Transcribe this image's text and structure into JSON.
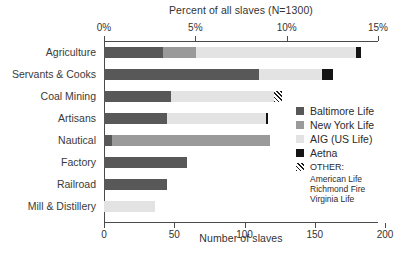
{
  "chart_data": {
    "type": "bar",
    "orientation": "horizontal",
    "stacked": true,
    "title": "Percent of all slaves (N=1300)",
    "xlabel_top": "Percent of all slaves (N=1300)",
    "xlabel_bottom": "Number of slaves",
    "ylabel": "",
    "categories": [
      "Agriculture",
      "Servants & Cooks",
      "Coal Mining",
      "Artisans",
      "Nautical",
      "Factory",
      "Railroad",
      "Mill & Distillery"
    ],
    "series": [
      {
        "name": "Baltimore Life",
        "color": "#585858",
        "values": [
          48,
          112,
          49,
          46,
          6,
          61,
          46,
          0
        ]
      },
      {
        "name": "New York Life",
        "color": "#9a9a9a",
        "values": [
          24,
          0,
          0,
          0,
          115,
          0,
          0,
          0
        ]
      },
      {
        "name": "AIG (US Life)",
        "color": "#e3e3e3",
        "values": [
          116,
          47,
          74,
          74,
          0,
          0,
          0,
          37
        ]
      },
      {
        "name": "Aetna",
        "color": "#141414",
        "values": [
          4,
          8,
          0,
          2,
          0,
          0,
          0,
          0
        ]
      },
      {
        "name": "OTHER",
        "color": "hatched",
        "values": [
          0,
          0,
          5,
          0,
          0,
          0,
          0,
          0
        ]
      }
    ],
    "totals": [
      192,
      167,
      128,
      122,
      121,
      61,
      46,
      37
    ],
    "x_top_ticks": [
      "0%",
      "5%",
      "10%",
      "15%"
    ],
    "x_top_values": [
      0,
      5,
      10,
      15
    ],
    "x_bottom_ticks": [
      "0",
      "50",
      "100",
      "150",
      "200"
    ],
    "x_bottom_values": [
      0,
      50,
      100,
      150,
      200
    ],
    "xlim_top": [
      0,
      15
    ],
    "xlim_bottom": [
      0,
      200
    ],
    "grid": false,
    "legend_position": "right"
  },
  "axis": {
    "top_title": "Percent of all slaves (N=1300)",
    "bottom_title": "Number of slaves",
    "top_ticks": [
      {
        "label": "0%",
        "pct": 0
      },
      {
        "label": "5%",
        "pct": 5
      },
      {
        "label": "10%",
        "pct": 10
      },
      {
        "label": "15%",
        "pct": 15
      }
    ],
    "bottom_ticks": [
      {
        "label": "0",
        "pct": 0
      },
      {
        "label": "50",
        "pct": 3.846
      },
      {
        "label": "100",
        "pct": 7.692
      },
      {
        "label": "150",
        "pct": 11.538
      },
      {
        "label": "200",
        "pct": 15.385
      }
    ]
  },
  "bars": [
    {
      "label": "Agriculture",
      "segments": [
        {
          "series": "Baltimore Life",
          "class": "baltimore",
          "start": 0.0,
          "len": 3.23
        },
        {
          "series": "New York Life",
          "class": "newyork",
          "start": 3.23,
          "len": 1.8
        },
        {
          "series": "AIG (US Life)",
          "class": "aig",
          "start": 5.03,
          "len": 8.74
        },
        {
          "series": "Aetna",
          "class": "aetna",
          "start": 13.77,
          "len": 0.3
        }
      ]
    },
    {
      "label": "Servants & Cooks",
      "segments": [
        {
          "series": "Baltimore Life",
          "class": "baltimore",
          "start": 0.0,
          "len": 8.48
        },
        {
          "series": "AIG (US Life)",
          "class": "aig",
          "start": 8.48,
          "len": 3.45
        },
        {
          "series": "Aetna",
          "class": "aetna",
          "start": 11.93,
          "len": 0.62
        }
      ]
    },
    {
      "label": "Coal Mining",
      "segments": [
        {
          "series": "Baltimore Life",
          "class": "baltimore",
          "start": 0.0,
          "len": 3.67
        },
        {
          "series": "AIG (US Life)",
          "class": "aig",
          "start": 3.67,
          "len": 5.65
        },
        {
          "series": "OTHER",
          "class": "other",
          "start": 9.32,
          "len": 0.4
        }
      ]
    },
    {
      "label": "Artisans",
      "segments": [
        {
          "series": "Baltimore Life",
          "class": "baltimore",
          "start": 0.0,
          "len": 3.45
        },
        {
          "series": "AIG (US Life)",
          "class": "aig",
          "start": 3.45,
          "len": 5.4
        },
        {
          "series": "Aetna",
          "class": "aetna",
          "start": 8.85,
          "len": 0.14
        }
      ]
    },
    {
      "label": "Nautical",
      "segments": [
        {
          "series": "Baltimore Life",
          "class": "baltimore",
          "start": 0.0,
          "len": 0.45
        },
        {
          "series": "New York Life",
          "class": "newyork",
          "start": 0.45,
          "len": 8.63
        }
      ]
    },
    {
      "label": "Factory",
      "segments": [
        {
          "series": "Baltimore Life",
          "class": "baltimore",
          "start": 0.0,
          "len": 4.54
        }
      ]
    },
    {
      "label": "Railroad",
      "segments": [
        {
          "series": "Baltimore Life",
          "class": "baltimore",
          "start": 0.0,
          "len": 3.45
        }
      ]
    },
    {
      "label": "Mill & Distillery",
      "segments": [
        {
          "series": "AIG (US Life)",
          "class": "aig",
          "start": 0.0,
          "len": 2.8
        }
      ]
    }
  ],
  "legend": {
    "entries": [
      {
        "label": "Baltimore Life",
        "class": "baltimore"
      },
      {
        "label": "New York Life",
        "class": "newyork"
      },
      {
        "label": "AIG (US Life)",
        "class": "aig"
      },
      {
        "label": "Aetna",
        "class": "aetna"
      },
      {
        "label": "OTHER:",
        "class": "other"
      }
    ],
    "other_members": [
      "American Life",
      "Richmond Fire",
      "Virginia Life"
    ]
  }
}
